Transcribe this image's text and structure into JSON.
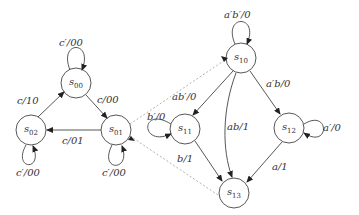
{
  "diagram": {
    "type": "state-machine",
    "left_machine": {
      "states": [
        {
          "id": "s00",
          "name": "s",
          "sub": "00"
        },
        {
          "id": "s01",
          "name": "s",
          "sub": "01"
        },
        {
          "id": "s02",
          "name": "s",
          "sub": "02"
        }
      ],
      "edges": [
        {
          "from": "s00",
          "to": "s00",
          "label": "c′/00"
        },
        {
          "from": "s00",
          "to": "s01",
          "label": "c/00"
        },
        {
          "from": "s01",
          "to": "s02",
          "label": "c/01"
        },
        {
          "from": "s02",
          "to": "s00",
          "label": "c/10"
        },
        {
          "from": "s02",
          "to": "s02",
          "label": "c′/00"
        },
        {
          "from": "s01",
          "to": "s01",
          "label": "c′/00"
        }
      ]
    },
    "right_machine": {
      "states": [
        {
          "id": "s10",
          "name": "s",
          "sub": "10"
        },
        {
          "id": "s11",
          "name": "s",
          "sub": "11"
        },
        {
          "id": "s12",
          "name": "s",
          "sub": "12"
        },
        {
          "id": "s13",
          "name": "s",
          "sub": "13"
        }
      ],
      "edges": [
        {
          "from": "s10",
          "to": "s10",
          "label": "a′b′/0"
        },
        {
          "from": "s10",
          "to": "s11",
          "label": "ab′/0"
        },
        {
          "from": "s10",
          "to": "s12",
          "label": "a′b/0"
        },
        {
          "from": "s10",
          "to": "s13",
          "label": "ab/1"
        },
        {
          "from": "s11",
          "to": "s11",
          "label": "b′/0"
        },
        {
          "from": "s11",
          "to": "s13",
          "label": "b/1"
        },
        {
          "from": "s12",
          "to": "s12",
          "label": "a′/0"
        },
        {
          "from": "s12",
          "to": "s13",
          "label": "a/1"
        }
      ]
    },
    "expansion_link": {
      "from": "s01",
      "to_region": [
        "s10",
        "s13"
      ],
      "style": "dotted"
    }
  }
}
